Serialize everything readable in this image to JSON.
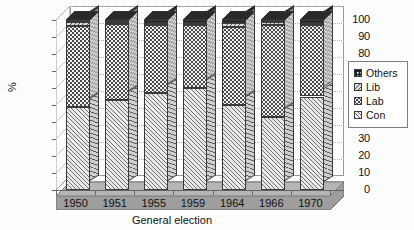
{
  "chart_data": {
    "type": "bar",
    "subtype": "stacked-column-3d",
    "title": "",
    "xlabel": "General election",
    "ylabel": "%",
    "categories": [
      "1950",
      "1951",
      "1955",
      "1959",
      "1964",
      "1966",
      "1970"
    ],
    "series": [
      {
        "name": "Con",
        "values": [
          49.0,
          53.0,
          57.0,
          60.0,
          50.0,
          43.0,
          55.0
        ]
      },
      {
        "name": "Lab",
        "values": [
          47.5,
          44.5,
          40.0,
          37.0,
          46.0,
          54.0,
          42.0
        ]
      },
      {
        "name": "Lib",
        "values": [
          2.5,
          1.5,
          1.5,
          1.0,
          2.0,
          2.0,
          1.0
        ]
      },
      {
        "name": "Others",
        "values": [
          1.0,
          1.0,
          1.5,
          2.0,
          2.0,
          1.0,
          2.0
        ]
      }
    ],
    "stack_order_bottom_to_top": [
      "Con",
      "Lab",
      "Lib",
      "Others"
    ],
    "ylim": [
      0,
      100
    ],
    "yticks": [
      "0",
      "10",
      "20",
      "30",
      "40",
      "50",
      "60",
      "70",
      "80",
      "90",
      "100"
    ],
    "grid": true,
    "grid_axis": "y",
    "grid_style": "dotted",
    "legend": {
      "position": "right",
      "entries": [
        {
          "label": "Others",
          "pattern": "others"
        },
        {
          "label": "Lib",
          "pattern": "lib"
        },
        {
          "label": "Lab",
          "pattern": "lab"
        },
        {
          "label": "Con",
          "pattern": "con"
        }
      ]
    },
    "colors": {
      "con": "#e9e9e9",
      "lab": "#f2f2f2",
      "lib": "#dcdcdc",
      "others": "#17171a",
      "floor": "#9e9e9e",
      "axis": "#666666",
      "grid": "#b4b4b4"
    }
  }
}
